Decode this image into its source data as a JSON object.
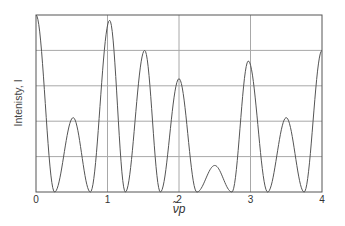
{
  "chart_data": {
    "type": "line",
    "title": "",
    "xlabel": "ν̃p",
    "ylabel": "Intenisty, I",
    "xlim": [
      0,
      4
    ],
    "ylim": [
      0,
      1
    ],
    "xticks": [
      0,
      1,
      2,
      3,
      4
    ],
    "xtick_labels": [
      "0",
      "1",
      "2",
      "3",
      "4"
    ],
    "ytick_labels": [],
    "grid": true,
    "grid_y_lines": 5,
    "legend": null,
    "colors": {
      "line": "#555555",
      "grid": "#a8a8a8",
      "frame": "#555555"
    },
    "peaks": [
      {
        "x": 0.0,
        "y": 1.0
      },
      {
        "x": 0.52,
        "y": 0.42
      },
      {
        "x": 1.03,
        "y": 0.97
      },
      {
        "x": 1.52,
        "y": 0.8
      },
      {
        "x": 2.0,
        "y": 0.64
      },
      {
        "x": 2.5,
        "y": 0.15
      },
      {
        "x": 2.97,
        "y": 0.74
      },
      {
        "x": 3.5,
        "y": 0.42
      },
      {
        "x": 4.0,
        "y": 0.8
      }
    ],
    "zeros": [
      0.26,
      0.76,
      1.25,
      1.74,
      2.25,
      2.74,
      3.24,
      3.75
    ]
  }
}
